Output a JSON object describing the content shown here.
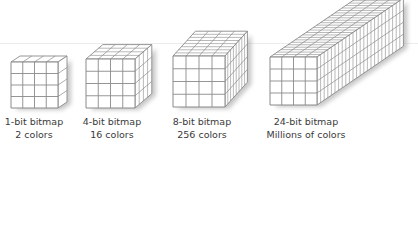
{
  "figure": {
    "background": "#ffffff",
    "line_color": "#8a8a8a",
    "face_color": "#ffffff",
    "text_color": "#3a3a3a"
  },
  "cubes": [
    {
      "name": "1-bit",
      "title": "1-bit bitmap",
      "subtitle": "2 colors",
      "grid": 4,
      "depth": 1,
      "front": {
        "x": 11,
        "y": 62,
        "w": 47,
        "h": 46
      },
      "layer_dx": 9,
      "layer_dy": -6,
      "label_center_x": 34
    },
    {
      "name": "4-bit",
      "title": "4-bit bitmap",
      "subtitle": "16 colors",
      "grid": 4,
      "depth": 4,
      "front": {
        "x": 86,
        "y": 59,
        "w": 49,
        "h": 49
      },
      "layer_dx": 4.2,
      "layer_dy": -3.6,
      "label_center_x": 112
    },
    {
      "name": "8-bit",
      "title": "8-bit bitmap",
      "subtitle": "256 colors",
      "grid": 4,
      "depth": 8,
      "front": {
        "x": 173,
        "y": 56,
        "w": 52,
        "h": 51
      },
      "layer_dx": 2.8,
      "layer_dy": -3.1,
      "label_center_x": 202
    },
    {
      "name": "24-bit",
      "title": "24-bit bitmap",
      "subtitle": "Millions of colors",
      "grid": 4,
      "depth": 24,
      "front": {
        "x": 270,
        "y": 57,
        "w": 47,
        "h": 48
      },
      "layer_dx": 3.6,
      "layer_dy": -2.45,
      "label_center_x": 306
    }
  ]
}
